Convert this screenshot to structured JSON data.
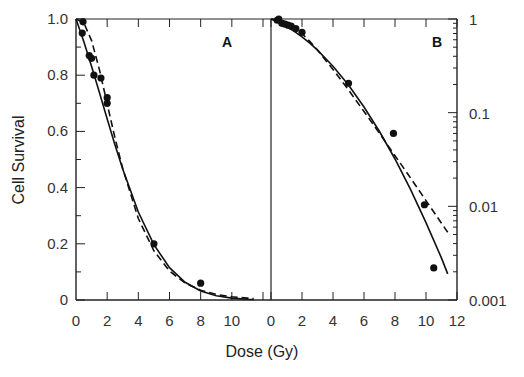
{
  "chart_data": {
    "type": "scatter",
    "xlabel": "Dose (Gy)",
    "ylabel": "Cell Survival",
    "panels": [
      {
        "label": "A",
        "yscale": "linear",
        "xlim": [
          0,
          12
        ],
        "ylim": [
          0,
          1.0
        ],
        "xticks": [
          0,
          2,
          4,
          6,
          8,
          10
        ],
        "yticks": [
          "0",
          "0.2",
          "0.4",
          "0.6",
          "0.8",
          "1.0"
        ],
        "points": [
          {
            "x": 0.45,
            "y": 0.99
          },
          {
            "x": 0.4,
            "y": 0.95
          },
          {
            "x": 0.85,
            "y": 0.87
          },
          {
            "x": 1.0,
            "y": 0.86
          },
          {
            "x": 1.15,
            "y": 0.8
          },
          {
            "x": 1.6,
            "y": 0.79
          },
          {
            "x": 2.0,
            "y": 0.72
          },
          {
            "x": 2.0,
            "y": 0.7
          },
          {
            "x": 5.0,
            "y": 0.2
          },
          {
            "x": 8.0,
            "y": 0.06
          }
        ]
      },
      {
        "label": "B",
        "yscale": "log",
        "xlim": [
          0,
          12
        ],
        "ylim": [
          0.001,
          1
        ],
        "xticks": [
          0,
          2,
          4,
          6,
          8,
          10,
          12
        ],
        "yticks": [
          "0.001",
          "0.01",
          "0.1",
          "1"
        ],
        "points": [
          {
            "x": 0.4,
            "y": 0.97
          },
          {
            "x": 0.5,
            "y": 1.0
          },
          {
            "x": 0.7,
            "y": 0.9
          },
          {
            "x": 0.9,
            "y": 0.88
          },
          {
            "x": 1.1,
            "y": 0.86
          },
          {
            "x": 1.3,
            "y": 0.84
          },
          {
            "x": 1.6,
            "y": 0.79
          },
          {
            "x": 2.0,
            "y": 0.72
          },
          {
            "x": 5.0,
            "y": 0.206
          },
          {
            "x": 7.9,
            "y": 0.06
          },
          {
            "x": 9.9,
            "y": 0.0104
          },
          {
            "x": 10.5,
            "y": 0.0022
          }
        ]
      }
    ],
    "series": [
      {
        "name": "solid-fit",
        "style": "solid",
        "x": [
          0,
          0.5,
          1,
          1.5,
          2,
          2.5,
          3,
          4,
          5,
          6,
          7,
          8,
          9,
          10,
          11,
          11.4
        ],
        "values": [
          1,
          0.92,
          0.831,
          0.738,
          0.644,
          0.552,
          0.465,
          0.313,
          0.197,
          0.115,
          0.063,
          0.032,
          0.0152,
          0.0067,
          0.0028,
          0.0019
        ]
      },
      {
        "name": "dashed-fit",
        "style": "dashed",
        "x": [
          0,
          0.5,
          1,
          1.5,
          2,
          2.5,
          3,
          4,
          5,
          6,
          7,
          8,
          9,
          10,
          11,
          11.4
        ],
        "values": [
          1,
          0.986,
          0.923,
          0.82,
          0.698,
          0.576,
          0.467,
          0.29,
          0.175,
          0.103,
          0.0602,
          0.0347,
          0.0201,
          0.0115,
          0.0066,
          0.0053
        ]
      }
    ],
    "grid": false,
    "legend": null
  }
}
